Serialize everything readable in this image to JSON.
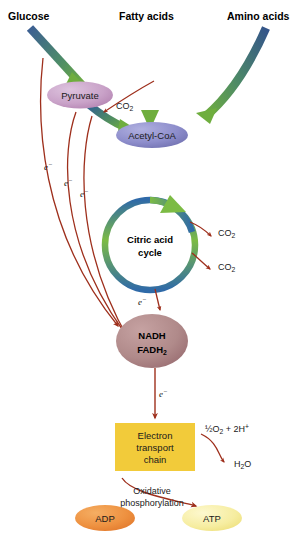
{
  "colors": {
    "arrow_blue": "#3c5f92",
    "arrow_green": "#6fae3e",
    "red": "#9e2f1c",
    "pyruvate_fill": "#c9a8cb",
    "acetylcoa_fill": "#8c8ccb",
    "cycle_blue": "#2f6aa8",
    "cycle_green": "#7cbb44",
    "nadh_fill": "#b08a8a",
    "etc_fill": "#f2cb3a",
    "adp_fill": "#ef9243",
    "atp_fill": "#f6eda3",
    "text": "#111111"
  },
  "inputs": [
    {
      "name": "glucose",
      "label": "Glucose"
    },
    {
      "name": "fatty-acids",
      "label": "Fatty acids"
    },
    {
      "name": "amino-acids",
      "label": "Amino acids"
    }
  ],
  "nodes": {
    "pyruvate": {
      "label": "Pyruvate"
    },
    "acetyl_coa": {
      "label": "Acetyl-CoA"
    },
    "cycle": {
      "line1": "Citric acid",
      "line2": "cycle"
    },
    "nadh": {
      "line1": "NADH",
      "line2_main": "FADH",
      "line2_sub": "2"
    },
    "etc": {
      "line1": "Electron",
      "line2": "transport",
      "line3": "chain"
    },
    "adp": {
      "label": "ADP"
    },
    "atp": {
      "label": "ATP"
    }
  },
  "outputs": {
    "co2_pyruvate": {
      "main": "CO",
      "sub": "2"
    },
    "co2_cycle_1": {
      "main": "CO",
      "sub": "2"
    },
    "co2_cycle_2": {
      "main": "CO",
      "sub": "2"
    },
    "oxygen": {
      "pre": "½O",
      "sub": "2",
      "mid": " + 2H",
      "sup": "+"
    },
    "water": {
      "pre": "H",
      "sub": "2",
      "post": "O"
    }
  },
  "electron_labels": [
    {
      "name": "e-minus-1",
      "text": "e",
      "sup": "−"
    },
    {
      "name": "e-minus-2",
      "text": "e",
      "sup": "−"
    },
    {
      "name": "e-minus-3",
      "text": "e",
      "sup": "−"
    },
    {
      "name": "e-minus-cycle",
      "text": "e",
      "sup": "−"
    },
    {
      "name": "e-minus-etc",
      "text": "e",
      "sup": "−"
    }
  ],
  "process_label": {
    "line1": "Oxidative",
    "line2": "phosphorylation"
  }
}
